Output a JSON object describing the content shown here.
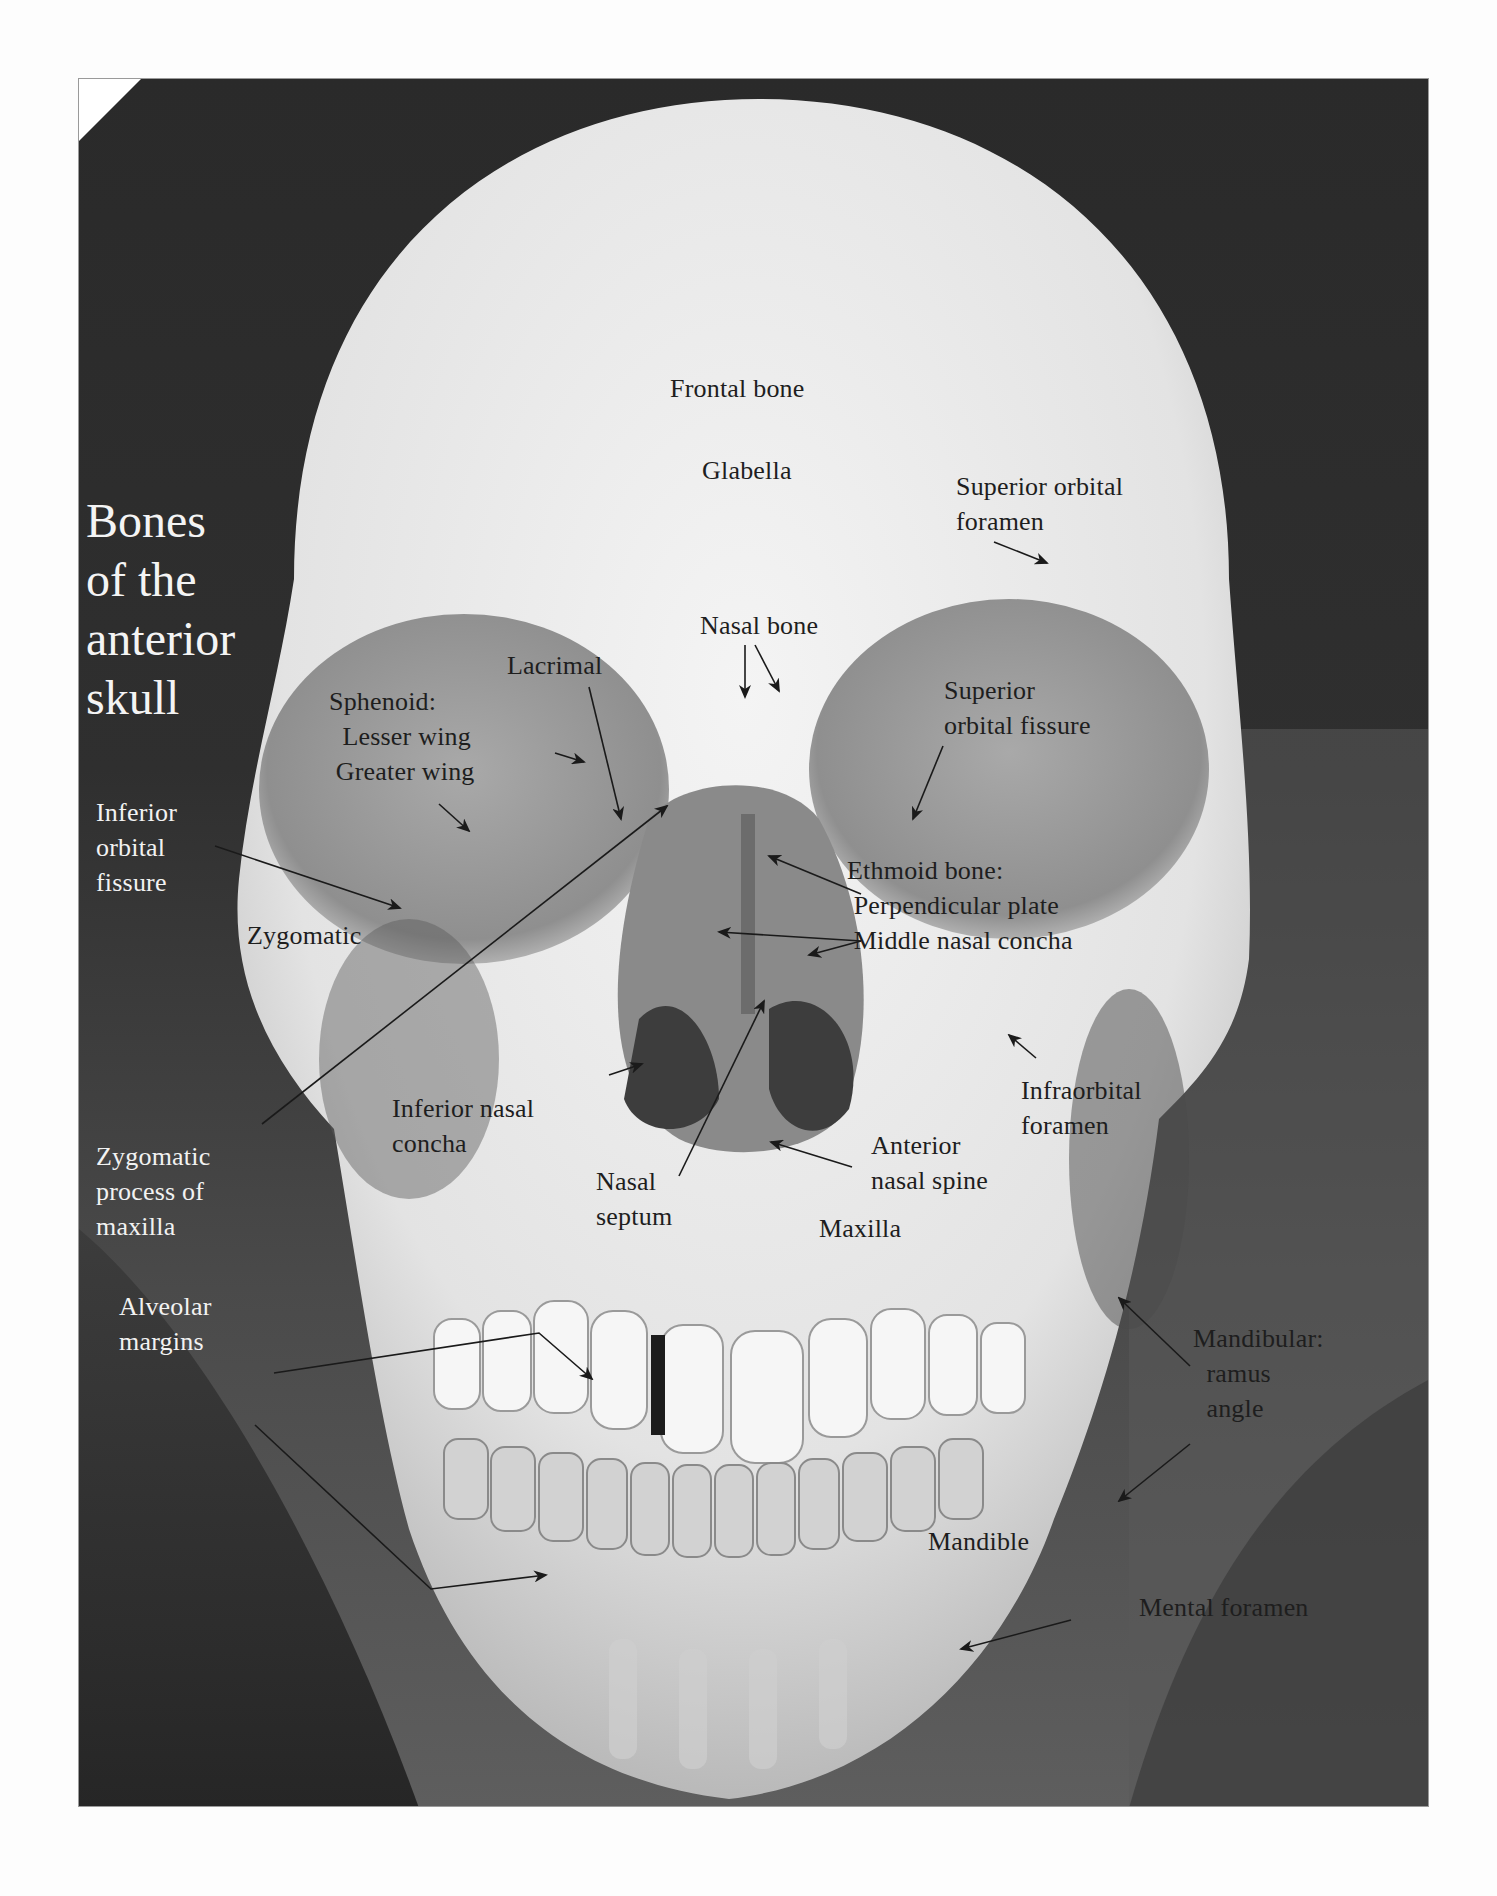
{
  "figure": {
    "title": "Bones\nof the\nanterior\nskull",
    "colors": {
      "background_dark": "#2a2a2a",
      "bone": "#e9e9e9",
      "label_dark": "#1e1e1e",
      "label_light": "#f2f2f2",
      "arrow": "#1a1a1a"
    }
  },
  "labels": [
    {
      "id": "frontal-bone",
      "text": "Frontal bone",
      "x": 591,
      "y": 292,
      "tone": "dark"
    },
    {
      "id": "glabella",
      "text": "Glabella",
      "x": 623,
      "y": 374,
      "tone": "dark"
    },
    {
      "id": "superior-orbital-foramen",
      "text": "Superior orbital\nforamen",
      "x": 877,
      "y": 390,
      "tone": "dark"
    },
    {
      "id": "nasal-bone",
      "text": "Nasal bone",
      "x": 621,
      "y": 529,
      "tone": "dark"
    },
    {
      "id": "lacrimal",
      "text": "Lacrimal",
      "x": 428,
      "y": 569,
      "tone": "dark"
    },
    {
      "id": "sphenoid",
      "text": "Sphenoid:\n  Lesser wing\n Greater wing",
      "x": 250,
      "y": 605,
      "tone": "dark"
    },
    {
      "id": "superior-orbital-fissure",
      "text": "Superior\norbital fissure",
      "x": 865,
      "y": 594,
      "tone": "dark"
    },
    {
      "id": "inferior-orbital-fissure",
      "text": "Inferior\norbital\nfissure",
      "x": 17,
      "y": 716,
      "tone": "light"
    },
    {
      "id": "ethmoid-bone",
      "text": "Ethmoid bone:\n Perpendicular plate\n Middle nasal concha",
      "x": 768,
      "y": 774,
      "tone": "dark"
    },
    {
      "id": "zygomatic",
      "text": "Zygomatic",
      "x": 168,
      "y": 839,
      "tone": "dark"
    },
    {
      "id": "infraorbital-foramen",
      "text": "Infraorbital\nforamen",
      "x": 942,
      "y": 994,
      "tone": "dark"
    },
    {
      "id": "inferior-nasal-concha",
      "text": "Inferior nasal\nconcha",
      "x": 313,
      "y": 1012,
      "tone": "dark"
    },
    {
      "id": "zygomatic-process-of-maxilla",
      "text": "Zygomatic\nprocess of\nmaxilla",
      "x": 17,
      "y": 1060,
      "tone": "light"
    },
    {
      "id": "anterior-nasal-spine",
      "text": "Anterior\nnasal spine",
      "x": 792,
      "y": 1049,
      "tone": "dark"
    },
    {
      "id": "nasal-septum",
      "text": "Nasal\nseptum",
      "x": 517,
      "y": 1085,
      "tone": "dark"
    },
    {
      "id": "maxilla",
      "text": "Maxilla",
      "x": 740,
      "y": 1132,
      "tone": "dark"
    },
    {
      "id": "alveolar-margins",
      "text": "Alveolar\nmargins",
      "x": 40,
      "y": 1210,
      "tone": "light"
    },
    {
      "id": "mandibular",
      "text": "Mandibular:\n  ramus\n  angle",
      "x": 1114,
      "y": 1242,
      "tone": "dark"
    },
    {
      "id": "mandible",
      "text": "Mandible",
      "x": 849,
      "y": 1445,
      "tone": "dark"
    },
    {
      "id": "mental-foramen",
      "text": "Mental foramen",
      "x": 1060,
      "y": 1511,
      "tone": "dark"
    }
  ],
  "arrows": [
    {
      "id": "arrow-superior-orbital-foramen",
      "x1": 915,
      "y1": 463,
      "x2": 968,
      "y2": 484
    },
    {
      "id": "arrow-nasal-bone-left",
      "x1": 666,
      "y1": 566,
      "x2": 666,
      "y2": 618
    },
    {
      "id": "arrow-nasal-bone-right",
      "x1": 676,
      "y1": 566,
      "x2": 700,
      "y2": 612
    },
    {
      "id": "arrow-lacrimal",
      "x1": 510,
      "y1": 608,
      "x2": 542,
      "y2": 740
    },
    {
      "id": "arrow-lesser-wing",
      "x1": 476,
      "y1": 674,
      "x2": 505,
      "y2": 683
    },
    {
      "id": "arrow-greater-wing",
      "x1": 360,
      "y1": 725,
      "x2": 390,
      "y2": 752
    },
    {
      "id": "arrow-superior-orbital-fissure",
      "x1": 864,
      "y1": 667,
      "x2": 834,
      "y2": 740
    },
    {
      "id": "arrow-inferior-orbital-fissure",
      "x1": 136,
      "y1": 767,
      "x2": 321,
      "y2": 829
    },
    {
      "id": "arrow-zygomatic-process",
      "x1": 183,
      "y1": 1045,
      "x2": 588,
      "y2": 727
    },
    {
      "id": "arrow-perpendicular-plate",
      "x1": 782,
      "y1": 815,
      "x2": 690,
      "y2": 777
    },
    {
      "id": "arrow-middle-concha-left",
      "x1": 782,
      "y1": 862,
      "x2": 640,
      "y2": 853
    },
    {
      "id": "arrow-middle-concha-right",
      "x1": 782,
      "y1": 862,
      "x2": 730,
      "y2": 876
    },
    {
      "id": "arrow-inferior-nasal-concha",
      "x1": 530,
      "y1": 996,
      "x2": 563,
      "y2": 985
    },
    {
      "id": "arrow-nasal-septum",
      "x1": 600,
      "y1": 1097,
      "x2": 685,
      "y2": 922
    },
    {
      "id": "arrow-anterior-nasal-spine",
      "x1": 773,
      "y1": 1088,
      "x2": 692,
      "y2": 1063
    },
    {
      "id": "arrow-infraorbital-foramen",
      "x1": 957,
      "y1": 979,
      "x2": 930,
      "y2": 956
    },
    {
      "id": "arrow-alveolar-upper",
      "x1": 195,
      "y1": 1294,
      "x2": 460,
      "y2": 1254,
      "x3": 513,
      "y3": 1300
    },
    {
      "id": "arrow-alveolar-lower",
      "x1": 176,
      "y1": 1346,
      "x2": 352,
      "y2": 1510,
      "x3": 467,
      "y3": 1496
    },
    {
      "id": "arrow-mandibular-ramus",
      "x1": 1111,
      "y1": 1287,
      "x2": 1040,
      "y2": 1219
    },
    {
      "id": "arrow-mandibular-angle",
      "x1": 1111,
      "y1": 1365,
      "x2": 1040,
      "y2": 1422
    },
    {
      "id": "arrow-mental-foramen",
      "x1": 992,
      "y1": 1541,
      "x2": 882,
      "y2": 1570
    }
  ]
}
